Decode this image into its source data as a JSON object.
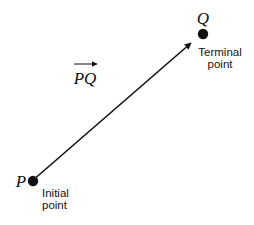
{
  "diagram": {
    "type": "vector",
    "vector_label": "PQ",
    "colors": {
      "ink": "#111111",
      "background": "#ffffff"
    },
    "initial": {
      "name": "P",
      "caption_line1": "Initial",
      "caption_line2": "point",
      "x": 32,
      "y": 181
    },
    "terminal": {
      "name": "Q",
      "caption_line1": "Terminal",
      "caption_line2": "point",
      "x": 203,
      "y": 34
    },
    "arrow": {
      "from": [
        32,
        181
      ],
      "to": [
        191,
        43
      ]
    }
  }
}
